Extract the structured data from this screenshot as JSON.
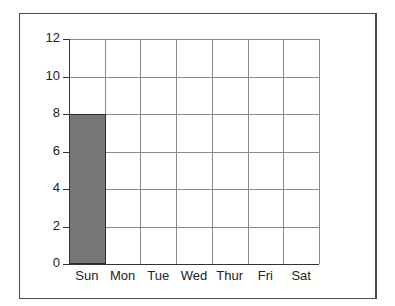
{
  "chart_data": {
    "type": "bar",
    "title": "",
    "xlabel": "",
    "ylabel": "",
    "categories": [
      "Sun",
      "Mon",
      "Tue",
      "Wed",
      "Thur",
      "Fri",
      "Sat"
    ],
    "values": [
      8,
      0,
      0,
      0,
      0,
      0,
      0
    ],
    "ylim": [
      0,
      12
    ],
    "yticks": [
      "0",
      "2",
      "4",
      "6",
      "8",
      "10",
      "12"
    ],
    "grid": true,
    "legend": null,
    "bar_color": "#777777",
    "bar_edge_color": "#2a2a2a"
  }
}
